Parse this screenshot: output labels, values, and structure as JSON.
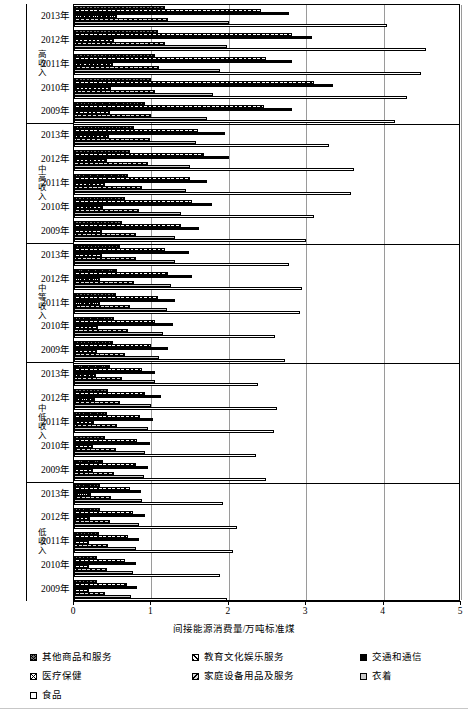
{
  "chart": {
    "xlabel": "间接能源消费量/万吨标准煤",
    "x_ticks": [
      "0",
      "1",
      "2",
      "3",
      "4",
      "5"
    ]
  },
  "legend": {
    "items": [
      {
        "label": "其他商品和服务",
        "pattern": "p-other"
      },
      {
        "label": "教育文化娱乐服务",
        "pattern": "p-edu"
      },
      {
        "label": "交通和通信",
        "pattern": "p-trans"
      },
      {
        "label": "医疗保健",
        "pattern": "p-med"
      },
      {
        "label": "家庭设备用品及服务",
        "pattern": "p-home"
      },
      {
        "label": "衣着",
        "pattern": "p-cloth"
      },
      {
        "label": "食品",
        "pattern": "p-food"
      }
    ]
  },
  "groups": [
    {
      "label": "高收入",
      "years": [
        "2013年",
        "2012年",
        "2011年",
        "2010年",
        "2009年"
      ]
    },
    {
      "label": "中高收入",
      "years": [
        "2013年",
        "2012年",
        "2011年",
        "2010年",
        "2009年"
      ]
    },
    {
      "label": "中等收入",
      "years": [
        "2013年",
        "2012年",
        "2011年",
        "2010年",
        "2009年"
      ]
    },
    {
      "label": "中低收入",
      "years": [
        "2013年",
        "2012年",
        "2011年",
        "2010年",
        "2009年"
      ]
    },
    {
      "label": "低收入",
      "years": [
        "2013年",
        "2012年",
        "2011年",
        "2010年",
        "2009年"
      ]
    }
  ],
  "chart_data": {
    "type": "bar",
    "orientation": "horizontal",
    "title": "",
    "xlabel": "间接能源消费量/万吨标准煤",
    "ylabel": "",
    "xlim": [
      0,
      5
    ],
    "xticks": [
      0,
      1,
      2,
      3,
      4,
      5
    ],
    "grid": true,
    "legend_position": "bottom",
    "series": [
      {
        "name": "其他商品和服务",
        "pattern": "p-other"
      },
      {
        "name": "教育文化娱乐服务",
        "pattern": "p-edu"
      },
      {
        "name": "交通和通信",
        "pattern": "p-trans"
      },
      {
        "name": "医疗保健",
        "pattern": "p-med"
      },
      {
        "name": "家庭设备用品及服务",
        "pattern": "p-home"
      },
      {
        "name": "衣着",
        "pattern": "p-cloth"
      },
      {
        "name": "食品",
        "pattern": "p-food"
      }
    ],
    "groups": [
      {
        "group": "高收入",
        "rows": [
          {
            "year": "2013年",
            "values": [
              1.18,
              2.42,
              2.78,
              0.55,
              1.22,
              2.0,
              4.05
            ]
          },
          {
            "year": "2012年",
            "values": [
              1.08,
              2.82,
              3.08,
              0.52,
              1.18,
              1.98,
              4.55
            ]
          },
          {
            "year": "2011年",
            "values": [
              1.05,
              2.48,
              2.82,
              0.5,
              1.1,
              1.88,
              4.48
            ]
          },
          {
            "year": "2010年",
            "values": [
              1.0,
              3.1,
              3.35,
              0.48,
              1.05,
              1.8,
              4.3
            ]
          },
          {
            "year": "2009年",
            "values": [
              0.92,
              2.45,
              2.82,
              0.46,
              1.0,
              1.72,
              4.15
            ]
          }
        ]
      },
      {
        "group": "中高收入",
        "rows": [
          {
            "year": "2013年",
            "values": [
              0.78,
              1.6,
              1.95,
              0.45,
              0.98,
              1.58,
              3.3
            ]
          },
          {
            "year": "2012年",
            "values": [
              0.72,
              1.68,
              2.0,
              0.42,
              0.95,
              1.5,
              3.62
            ]
          },
          {
            "year": "2011年",
            "values": [
              0.7,
              1.5,
              1.72,
              0.4,
              0.88,
              1.45,
              3.58
            ]
          },
          {
            "year": "2010年",
            "values": [
              0.66,
              1.52,
              1.78,
              0.38,
              0.84,
              1.38,
              3.1
            ]
          },
          {
            "year": "2009年",
            "values": [
              0.62,
              1.38,
              1.62,
              0.36,
              0.8,
              1.3,
              3.0
            ]
          }
        ]
      },
      {
        "group": "中等收入",
        "rows": [
          {
            "year": "2013年",
            "values": [
              0.6,
              1.18,
              1.48,
              0.36,
              0.8,
              1.3,
              2.78
            ]
          },
          {
            "year": "2012年",
            "values": [
              0.56,
              1.22,
              1.52,
              0.34,
              0.78,
              1.25,
              2.95
            ]
          },
          {
            "year": "2011年",
            "values": [
              0.54,
              1.08,
              1.3,
              0.33,
              0.72,
              1.2,
              2.92
            ]
          },
          {
            "year": "2010年",
            "values": [
              0.52,
              1.05,
              1.28,
              0.31,
              0.7,
              1.15,
              2.6
            ]
          },
          {
            "year": "2009年",
            "values": [
              0.5,
              1.0,
              1.22,
              0.3,
              0.66,
              1.1,
              2.72
            ]
          }
        ]
      },
      {
        "group": "中低收入",
        "rows": [
          {
            "year": "2013年",
            "values": [
              0.46,
              0.88,
              1.05,
              0.28,
              0.62,
              1.05,
              2.38
            ]
          },
          {
            "year": "2012年",
            "values": [
              0.44,
              0.92,
              1.12,
              0.27,
              0.6,
              1.0,
              2.62
            ]
          },
          {
            "year": "2011年",
            "values": [
              0.42,
              0.85,
              1.02,
              0.26,
              0.56,
              0.96,
              2.58
            ]
          },
          {
            "year": "2010年",
            "values": [
              0.4,
              0.82,
              0.98,
              0.25,
              0.54,
              0.92,
              2.35
            ]
          },
          {
            "year": "2009年",
            "values": [
              0.38,
              0.8,
              0.96,
              0.24,
              0.52,
              0.9,
              2.48
            ]
          }
        ]
      },
      {
        "group": "低收入",
        "rows": [
          {
            "year": "2013年",
            "values": [
              0.34,
              0.72,
              0.86,
              0.22,
              0.48,
              0.88,
              1.92
            ]
          },
          {
            "year": "2012年",
            "values": [
              0.33,
              0.76,
              0.92,
              0.21,
              0.46,
              0.84,
              2.1
            ]
          },
          {
            "year": "2011年",
            "values": [
              0.32,
              0.7,
              0.84,
              0.2,
              0.44,
              0.8,
              2.05
            ]
          },
          {
            "year": "2010年",
            "values": [
              0.3,
              0.66,
              0.8,
              0.19,
              0.42,
              0.76,
              1.88
            ]
          },
          {
            "year": "2009年",
            "values": [
              0.3,
              0.68,
              0.82,
              0.19,
              0.4,
              0.74,
              1.98
            ]
          }
        ]
      }
    ]
  }
}
